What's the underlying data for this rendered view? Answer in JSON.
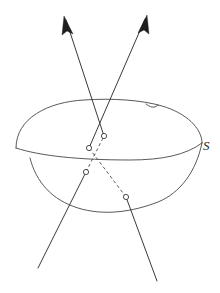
{
  "figure": {
    "type": "geometry-diagram",
    "background_color": "#ffffff",
    "stroke_color": "#2e2e2e",
    "canvas": {
      "width": 220,
      "height": 293
    },
    "labels": {
      "surface": "S",
      "surface_label_x": 203,
      "surface_label_y": 139,
      "caption": "",
      "caption_y": 283
    },
    "surface": {
      "name": "S",
      "description": "closed ovoid surface drawn as a blob with visible equator rim and lower hull",
      "top_rim_path": "M 16,148 C 16,118 48,102 84,100 C 112,98 142,100 162,106 C 186,113 202,128 202,143",
      "equator_path": "M 16,148 C 40,156 80,160 130,160 C 162,160 186,155 202,143",
      "lower_hull_path": "M 30,158 C 36,182 52,200 78,208 C 104,216 132,212 158,202 C 180,193 196,172 202,143",
      "bump_detail_path": "M 146,104 C 150,107 154,109 158,105"
    },
    "lines": [
      {
        "id": "line-left",
        "description": "ray entering lower-left, exiting upper-left with arrowhead",
        "visible_lower_path": "M 38,268 L 86,172",
        "hidden_path": "M 86,172 L 104,136",
        "visible_upper_path": "M 104,136 L 66,20",
        "arrow_tip": {
          "x": 64,
          "y": 16
        },
        "arrow_angle_deg": -108,
        "entry_point": {
          "x": 86,
          "y": 172,
          "label": ""
        },
        "exit_point": {
          "x": 104,
          "y": 136,
          "label": ""
        }
      },
      {
        "id": "line-right",
        "description": "ray entering lower-right, exiting upper-right with arrowhead",
        "visible_lower_path": "M 157,281 L 126,197",
        "hidden_path": "M 126,197 L 89,148",
        "visible_upper_path": "M 89,148 L 145,19",
        "arrow_tip": {
          "x": 147,
          "y": 15
        },
        "arrow_angle_deg": -66,
        "entry_point": {
          "x": 126,
          "y": 197,
          "label": ""
        },
        "exit_point": {
          "x": 89,
          "y": 148,
          "label": ""
        }
      }
    ],
    "intersection_points": [
      {
        "id": "pt-left-near",
        "x": 86,
        "y": 172,
        "radius": 2.6,
        "marker": "open-circle"
      },
      {
        "id": "pt-left-far",
        "x": 104,
        "y": 136,
        "radius": 2.6,
        "marker": "open-circle"
      },
      {
        "id": "pt-right-near",
        "x": 126,
        "y": 197,
        "radius": 2.6,
        "marker": "open-circle"
      },
      {
        "id": "pt-right-far",
        "x": 89,
        "y": 148,
        "radius": 2.6,
        "marker": "open-circle"
      }
    ]
  }
}
